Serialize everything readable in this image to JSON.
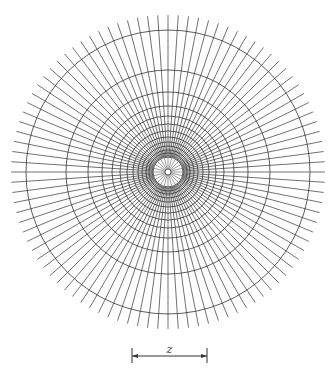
{
  "figure": {
    "type": "polar-grid-diagram",
    "center": [
      168,
      172
    ],
    "ray_count": 96,
    "ray_inner_radius": 16,
    "ray_outer_radius": 157,
    "ring_radii": [
      3,
      15,
      16,
      19,
      22,
      26,
      30,
      35,
      41,
      48,
      56,
      66,
      80,
      102,
      142
    ],
    "core_spoke_count": 24,
    "core_spoke_inner_radius": 3,
    "core_spoke_outer_radius": 15,
    "stroke_color": "#333333",
    "background": "#ffffff"
  },
  "scale_bar": {
    "label": "z",
    "x1": 132,
    "x2": 207,
    "y": 356,
    "tick_top": 348,
    "tick_bottom": 363
  }
}
